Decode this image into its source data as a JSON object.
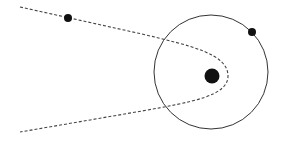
{
  "diagram": {
    "type": "orbital-trajectory",
    "canvas": {
      "width": 285,
      "height": 141,
      "background": "#ffffff"
    },
    "colors": {
      "stroke": "#333333",
      "trajectory": "#444444",
      "body": "#111111"
    },
    "orbit_circle": {
      "cx": 211,
      "cy": 72,
      "r": 57
    },
    "central_body": {
      "cx": 212,
      "cy": 76,
      "r": 7.5
    },
    "orbiting_body": {
      "cx": 252,
      "cy": 32,
      "r": 4
    },
    "incoming_body": {
      "cx": 68,
      "cy": 18,
      "r": 4
    },
    "hyperbolic_path": {
      "style": "dashed",
      "points": [
        [
          20,
          7
        ],
        [
          68,
          18
        ],
        [
          162,
          40
        ],
        [
          228,
          76
        ],
        [
          162,
          107
        ],
        [
          20,
          132
        ]
      ]
    }
  }
}
